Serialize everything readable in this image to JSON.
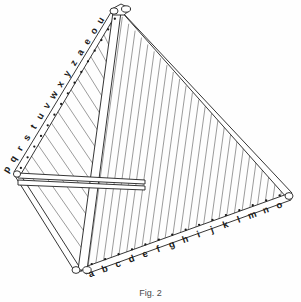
{
  "figure": {
    "caption": "Fig. 2",
    "line_color": "#2b2b2b",
    "label_color": "#1a1a1a",
    "background": "#ffffff"
  },
  "left_edge": {
    "name": "left-edge-labels",
    "labels": [
      "p",
      "q",
      "r",
      "s",
      "t",
      "u",
      "v",
      "w",
      "x",
      "y",
      "z",
      "a",
      "e",
      "o",
      "u"
    ]
  },
  "bottom_edge": {
    "name": "bottom-edge-labels",
    "labels": [
      "a",
      "b",
      "c",
      "d",
      "e",
      "f",
      "g",
      "h",
      "i",
      "j",
      "k",
      "l",
      "m",
      "n",
      "o"
    ]
  },
  "geometry": {
    "apex": [
      116,
      10
    ],
    "left_vertex": [
      14,
      172
    ],
    "bottom_vertex": [
      80,
      272
    ],
    "right_vertex": [
      288,
      196
    ],
    "string_count": 26,
    "crossbar_count": 2
  }
}
